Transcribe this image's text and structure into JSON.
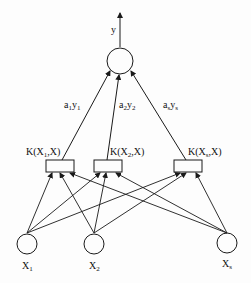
{
  "diagram": {
    "type": "svm-kernel-network",
    "output": {
      "label": "y",
      "subscript": ""
    },
    "weights": [
      {
        "a": "a",
        "a_sub": "1",
        "y": "y",
        "y_sub": "1"
      },
      {
        "a": "a",
        "a_sub": "2",
        "y": "y",
        "y_sub": "2"
      },
      {
        "a": "a",
        "a_sub": "s",
        "y": "y",
        "y_sub": "s"
      }
    ],
    "kernels": [
      {
        "prefix": "K(X",
        "sub": "1",
        "suffix": ",X)"
      },
      {
        "prefix": "K(X",
        "sub": "2",
        "suffix": ",X)"
      },
      {
        "prefix": "K(X",
        "sub": "s",
        "suffix": ",X)"
      }
    ],
    "inputs": [
      {
        "label": "X",
        "sub": "1"
      },
      {
        "label": "X",
        "sub": "2"
      },
      {
        "label": "X",
        "sub": "s"
      }
    ],
    "colors": {
      "stroke": "#1a1a1a",
      "background": "#fdfdfd"
    }
  }
}
